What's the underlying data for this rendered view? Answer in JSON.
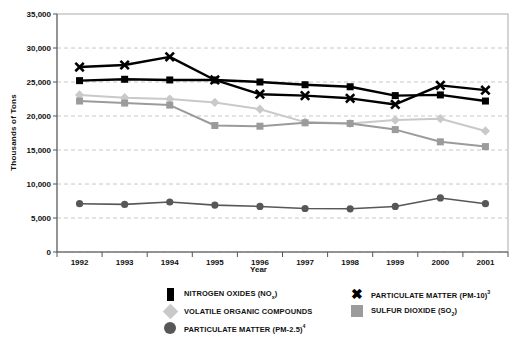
{
  "chart_data": {
    "type": "line",
    "title": "",
    "xlabel": "Year",
    "ylabel": "Thousands of Tons",
    "x": [
      1992,
      1993,
      1994,
      1995,
      1996,
      1997,
      1998,
      1999,
      2000,
      2001
    ],
    "xtick_labels": [
      "1992",
      "1993",
      "1994",
      "1995",
      "1996",
      "1997",
      "1998",
      "1999",
      "2000",
      "2001"
    ],
    "ylim": [
      0,
      35000
    ],
    "ytick_values": [
      0,
      5000,
      10000,
      15000,
      20000,
      25000,
      30000,
      35000
    ],
    "ytick_labels": [
      "0",
      "5,000",
      "10,000",
      "15,000",
      "20,000",
      "25,000",
      "30,000",
      "35,000"
    ],
    "grid": "horizontal-dashed",
    "legend_position": "bottom",
    "series": [
      {
        "name": "NITROGEN OXIDES (NOx)",
        "key": "nox",
        "marker": "square",
        "color": "#000000",
        "values": [
          25200,
          25400,
          25300,
          25300,
          25000,
          24600,
          24300,
          23000,
          23100,
          22200
        ]
      },
      {
        "name": "PARTICULATE MATTER (PM-10)",
        "key": "pm10",
        "marker": "x",
        "color": "#000000",
        "values": [
          27200,
          27500,
          28700,
          25300,
          23200,
          23000,
          22600,
          21700,
          24500,
          23800
        ]
      },
      {
        "name": "VOLATILE ORGANIC COMPOUNDS",
        "key": "voc",
        "marker": "diamond",
        "color": "#c9c9c9",
        "values": [
          23100,
          22700,
          22500,
          22000,
          21000,
          19100,
          18900,
          19400,
          19600,
          17800
        ]
      },
      {
        "name": "SULFUR DIOXIDE (SO2)",
        "key": "so2",
        "marker": "square",
        "color": "#9b9b9b",
        "values": [
          22200,
          21900,
          21600,
          18600,
          18500,
          19000,
          18900,
          18000,
          16200,
          15500
        ]
      },
      {
        "name": "PARTICULATE MATTER (PM-2.5)",
        "key": "pm25",
        "marker": "circle",
        "color": "#575757",
        "values": [
          7100,
          7000,
          7350,
          6900,
          6700,
          6400,
          6350,
          6700,
          7950,
          7100
        ]
      }
    ]
  },
  "axes": {
    "y_title": "Thousands of Tons",
    "x_title": "Year"
  },
  "legend": {
    "items": [
      {
        "id": "nox",
        "marker": "square-black",
        "label_html": "NITROGEN OXIDES (NO<sub>x</sub>)"
      },
      {
        "id": "pm10",
        "marker": "x-black",
        "label_html": "PARTICULATE MATTER (PM-10)<sup>3</sup>"
      },
      {
        "id": "voc",
        "marker": "diamond-light",
        "label_html": "VOLATILE ORGANIC COMPOUNDS"
      },
      {
        "id": "so2",
        "marker": "square-gray",
        "label_html": "SULFUR DIOXIDE (SO<sub>2</sub>)"
      },
      {
        "id": "pm25",
        "marker": "circle-dark",
        "label_html": "PARTICULATE MATTER (PM-2.5)<sup>4</sup>"
      }
    ]
  },
  "colors": {
    "nox": "#000000",
    "pm10": "#000000",
    "voc": "#c9c9c9",
    "so2": "#9b9b9b",
    "pm25": "#575757",
    "grid": "#c8c8c8",
    "axis": "#555555",
    "border": "#aaaaaa"
  }
}
